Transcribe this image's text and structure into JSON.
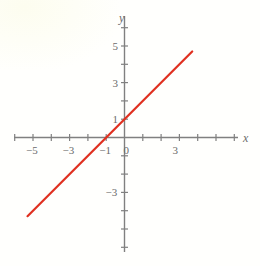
{
  "figure": {
    "background_color": "#fffffd",
    "axis_color": "#808080",
    "label_color": "#6b6b6b",
    "line_color": "#e03020",
    "x_axis_name": "x",
    "y_axis_name": "y"
  },
  "chart_data": {
    "type": "line",
    "title": "",
    "xlabel": "x",
    "ylabel": "y",
    "grid": false,
    "legend": "none",
    "xlim": [
      -6.8,
      7.4
    ],
    "ylim": [
      -6.7,
      7.0
    ],
    "x_ticks": [
      -6,
      -5,
      -4,
      -3,
      -2,
      -1,
      1,
      2,
      3,
      4,
      5,
      6
    ],
    "y_ticks": [
      -6,
      -5,
      -4,
      -3,
      -2,
      -1,
      1,
      2,
      3,
      4,
      5,
      6
    ],
    "x_tick_labels": [
      {
        "value": -5,
        "text": "−5"
      },
      {
        "value": -3,
        "text": "−3"
      },
      {
        "value": -1,
        "text": "−1"
      },
      {
        "value": 0,
        "text": "0"
      },
      {
        "value": 3,
        "text": "3"
      }
    ],
    "y_tick_labels": [
      {
        "value": 5,
        "text": "5"
      },
      {
        "value": 3,
        "text": "3"
      },
      {
        "value": 1,
        "text": "1"
      },
      {
        "value": -3,
        "text": "−3"
      }
    ],
    "series": [
      {
        "name": "y = x + 1",
        "equation": "y = x + 1",
        "slope": 1,
        "intercept": 1,
        "color": "#e03020",
        "x": [
          -5.3,
          3.7
        ],
        "y": [
          -4.3,
          4.7
        ],
        "x_intercept": -1,
        "y_intercept": 1
      }
    ]
  }
}
